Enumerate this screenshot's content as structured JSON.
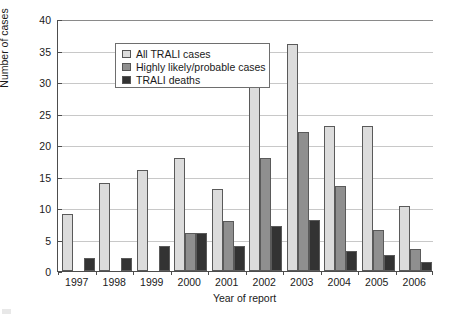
{
  "chart_data": {
    "type": "bar",
    "title": "",
    "xlabel": "Year of report",
    "ylabel": "Number of cases",
    "categories": [
      "1997",
      "1998",
      "1999",
      "2000",
      "2001",
      "2002",
      "2003",
      "2004",
      "2005",
      "2006"
    ],
    "ylim": [
      0,
      40
    ],
    "ytick_values": [
      0,
      5,
      10,
      15,
      20,
      25,
      30,
      35,
      40
    ],
    "ytick_labels": [
      "0",
      "5",
      "10",
      "15",
      "20",
      "25",
      "30",
      "35",
      "40"
    ],
    "grid": "horizontal",
    "legend_position": "top-left inside plot",
    "series": [
      {
        "name": "All TRALI cases",
        "color": "#dcdcdc",
        "values": [
          9,
          14,
          16,
          18,
          13,
          33,
          36,
          23,
          23,
          10.3
        ]
      },
      {
        "name": "Highly likely/probable cases",
        "color": "#8f8f8f",
        "values": [
          null,
          null,
          null,
          6,
          8,
          18,
          22,
          13.5,
          6.5,
          3.5
        ]
      },
      {
        "name": "TRALI deaths",
        "color": "#333333",
        "values": [
          2,
          2,
          4,
          6,
          4,
          7.2,
          8.1,
          3.1,
          2.5,
          1.5
        ]
      }
    ]
  },
  "legend": {
    "items": [
      {
        "label": "All TRALI cases",
        "swatch": "#dcdcdc"
      },
      {
        "label": "Highly likely/probable cases",
        "swatch": "#8f8f8f"
      },
      {
        "label": "TRALI deaths",
        "swatch": "#333333"
      }
    ]
  },
  "axes": {
    "y_title": "Number of cases",
    "x_title": "Year of report"
  }
}
